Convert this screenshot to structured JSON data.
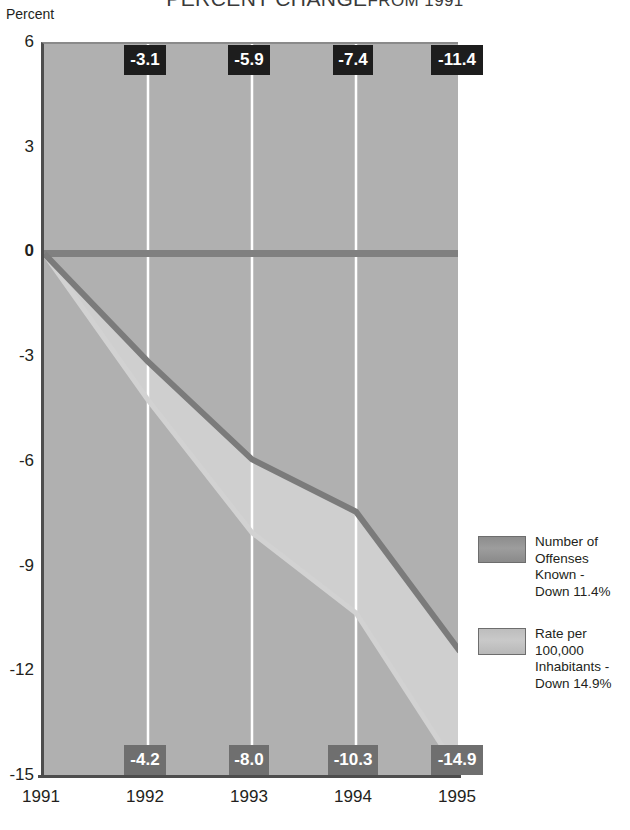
{
  "chart_data": {
    "type": "line",
    "title_main": "PERCENT CHANGE",
    "title_tail": "FROM 1991",
    "ylabel": "Percent",
    "xlabel": "",
    "grid": true,
    "legend_position": "right",
    "ylim": [
      -15,
      6
    ],
    "yticks": [
      "6",
      "3",
      "0",
      "-3",
      "-6",
      "-9",
      "-12",
      "-15"
    ],
    "ytick_values": [
      6,
      3,
      0,
      -3,
      -6,
      -9,
      -12,
      -15
    ],
    "categories": [
      "1991",
      "1992",
      "1993",
      "1994",
      "1995"
    ],
    "x": [
      1991,
      1992,
      1993,
      1994,
      1995
    ],
    "series": [
      {
        "name": "Number of Offenses Known - Down 11.4%",
        "legend_line1": "Number of",
        "legend_line2": "Offenses Known -",
        "legend_line3": "Down 11.4%",
        "color": "#7b7b7b",
        "values": [
          0.0,
          -3.1,
          -5.9,
          -7.4,
          -11.4
        ],
        "labels": [
          "",
          "-3.1",
          "-5.9",
          "-7.4",
          "-11.4"
        ],
        "label_style": "top"
      },
      {
        "name": "Rate per 100,000 Inhabitants - Down 14.9%",
        "legend_line1": "Rate per 100,000",
        "legend_line2": "Inhabitants -",
        "legend_line3": "Down 14.9%",
        "color": "#cccccc",
        "values": [
          0.0,
          -4.2,
          -8.0,
          -10.3,
          -14.9
        ],
        "labels": [
          "",
          "-4.2",
          "-8.0",
          "-10.3",
          "-14.9"
        ],
        "label_style": "bottom"
      }
    ],
    "top_labels": [
      "-3.1",
      "-5.9",
      "-7.4",
      "-11.4"
    ],
    "bottom_labels": [
      "-4.2",
      "-8.0",
      "-10.3",
      "-14.9"
    ],
    "colors": {
      "plot_background": "#b0b0b0",
      "band_fill": "#cfcfcf",
      "offenses_line": "#7b7b7b",
      "rate_line": "#d2d2d2",
      "gridline": "#ffffff",
      "axis": "#4d4d4d",
      "top_label_bg": "#1d1d1d",
      "bottom_label_bg": "#6f6f6f",
      "label_text": "#ffffff",
      "text": "#231f20"
    }
  }
}
